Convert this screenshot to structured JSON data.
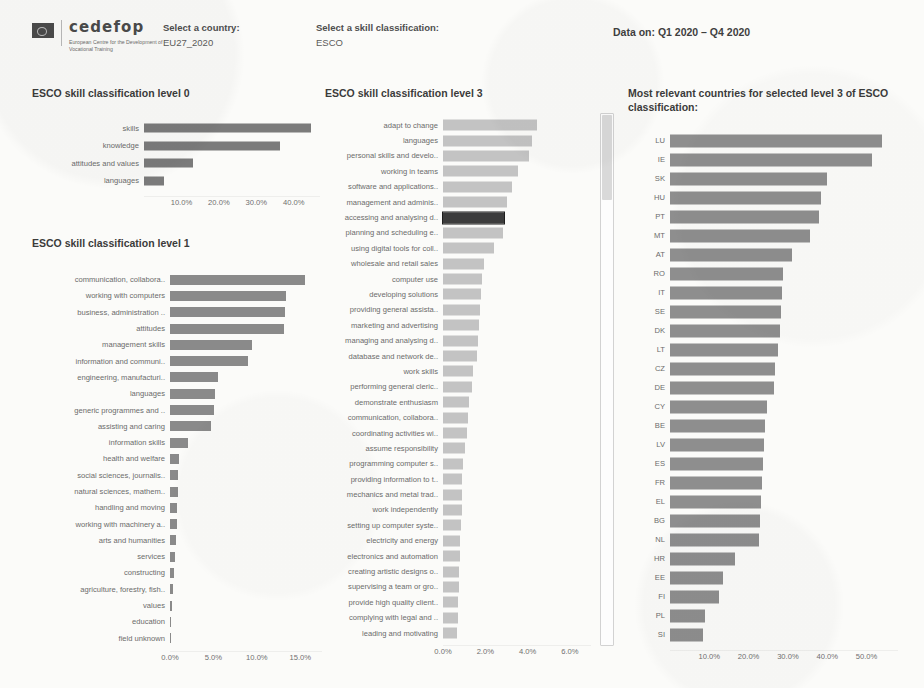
{
  "header": {
    "logo": {
      "name": "cedefop",
      "subtitle": "European Centre for the Development of Vocational Training",
      "flag_icon": "eu-flag-icon"
    },
    "country_field": {
      "label": "Select a country:",
      "value": "EU27_2020"
    },
    "skill_field": {
      "label": "Select a skill classification:",
      "value": "ESCO"
    },
    "data_on": "Data on: Q1 2020 – Q4 2020"
  },
  "colors": {
    "bar_level0": "#7b7b7b",
    "bar_level1": "#8a8a8a",
    "bar_level3": "#c3c3c3",
    "bar_level3_selected": "#3c3c3c",
    "bar_country": "#8e8e8e",
    "text": "#6b6b6b"
  },
  "panels": {
    "level0": {
      "title": "ESCO skill classification level 0"
    },
    "level1": {
      "title": "ESCO skill classification level 1"
    },
    "level3": {
      "title": "ESCO skill classification level 3"
    },
    "countries": {
      "title": "Most relevant countries for selected level 3 of ESCO classification:"
    }
  },
  "chart_data": [
    {
      "id": "level0",
      "type": "bar",
      "orientation": "horizontal",
      "title": "ESCO skill classification level 0",
      "xlabel": "",
      "ylabel": "",
      "xlim": [
        0,
        47
      ],
      "xticks": [
        10,
        20,
        30,
        40
      ],
      "xticklabels": [
        "10.0%",
        "20.0%",
        "30.0%",
        "40.0%"
      ],
      "grid": false,
      "legend": "none",
      "categories": [
        "skills",
        "knowledge",
        "attitudes and values",
        "languages"
      ],
      "values": [
        44.5,
        36.2,
        13.0,
        5.3
      ]
    },
    {
      "id": "level1",
      "type": "bar",
      "orientation": "horizontal",
      "title": "ESCO skill classification level 1",
      "xlabel": "",
      "ylabel": "",
      "xlim": [
        0,
        17.5
      ],
      "xticks": [
        0,
        5,
        10,
        15
      ],
      "xticklabels": [
        "0.0%",
        "5.0%",
        "10.0%",
        "15.0%"
      ],
      "grid": false,
      "legend": "none",
      "categories": [
        "communication, collabora..",
        "working with computers",
        "business, administration ..",
        "attitudes",
        "management skills",
        "information and communi..",
        "engineering, manufacturi..",
        "languages",
        "generic programmes and ..",
        "assisting and caring",
        "information skills",
        "health and welfare",
        "social sciences, journalis..",
        "natural sciences, mathem..",
        "handling and moving",
        "working with machinery a..",
        "arts and humanities",
        "services",
        "constructing",
        "agriculture, forestry, fish..",
        "values",
        "education",
        "field unknown"
      ],
      "values": [
        15.6,
        13.3,
        13.2,
        13.1,
        9.4,
        9.0,
        5.5,
        5.2,
        5.1,
        4.7,
        2.1,
        1.0,
        0.95,
        0.9,
        0.85,
        0.8,
        0.65,
        0.6,
        0.5,
        0.35,
        0.2,
        0.05,
        0.02
      ]
    },
    {
      "id": "level3",
      "type": "bar",
      "orientation": "horizontal",
      "title": "ESCO skill classification level 3",
      "xlabel": "",
      "ylabel": "",
      "xlim": [
        0,
        7.0
      ],
      "xticks": [
        0,
        2,
        4,
        6
      ],
      "xticklabels": [
        "0.0%",
        "2.0%",
        "4.0%",
        "6.0%"
      ],
      "grid": false,
      "legend": "none",
      "selected_category": "accessing and analysing d..",
      "categories": [
        "adapt to change",
        "languages",
        "personal skills and develo..",
        "working in teams",
        "software and applications..",
        "management and adminis..",
        "accessing and analysing d..",
        "planning and scheduling e..",
        "using digital tools for coll..",
        "wholesale and retail sales",
        "computer use",
        "developing solutions",
        "providing general assista..",
        "marketing and advertising",
        "managing and analysing d..",
        "database and network de..",
        "work skills",
        "performing general cleric..",
        "demonstrate enthusiasm",
        "communication, collabora..",
        "coordinating activities wi..",
        "assume responsibility",
        "programming computer s..",
        "providing information to t..",
        "mechanics and metal trad..",
        "work independently",
        "setting up computer syste..",
        "electricity and energy",
        "electronics and automation",
        "creating artistic designs o..",
        "supervising a team or gro..",
        "provide high quality client..",
        "complying with legal and ..",
        "leading and motivating"
      ],
      "values": [
        4.45,
        4.2,
        4.05,
        3.55,
        3.25,
        3.05,
        2.9,
        2.85,
        2.4,
        1.95,
        1.85,
        1.8,
        1.75,
        1.7,
        1.65,
        1.6,
        1.4,
        1.35,
        1.25,
        1.2,
        1.15,
        1.05,
        0.95,
        0.92,
        0.9,
        0.88,
        0.85,
        0.82,
        0.8,
        0.78,
        0.75,
        0.72,
        0.7,
        0.68
      ]
    },
    {
      "id": "countries",
      "type": "bar",
      "orientation": "horizontal",
      "title": "Most relevant countries for selected level 3 of ESCO classification:",
      "xlabel": "",
      "ylabel": "",
      "xlim": [
        0,
        58
      ],
      "xticks": [
        10,
        20,
        30,
        40,
        50
      ],
      "xticklabels": [
        "10.0%",
        "20.0%",
        "30.0%",
        "40.0%",
        "50.0%"
      ],
      "grid": false,
      "legend": "none",
      "categories": [
        "LU",
        "IE",
        "SK",
        "HU",
        "PT",
        "MT",
        "AT",
        "RO",
        "IT",
        "SE",
        "DK",
        "LT",
        "CZ",
        "DE",
        "CY",
        "BE",
        "LV",
        "ES",
        "FR",
        "EL",
        "BG",
        "NL",
        "HR",
        "EE",
        "FI",
        "PL",
        "SI"
      ],
      "values": [
        54.0,
        51.5,
        40.0,
        38.5,
        37.8,
        35.5,
        31.0,
        28.8,
        28.5,
        28.2,
        28.0,
        27.4,
        26.6,
        26.5,
        24.8,
        24.2,
        23.8,
        23.6,
        23.4,
        23.2,
        23.0,
        22.6,
        16.5,
        13.5,
        12.5,
        9.0,
        8.5
      ]
    }
  ],
  "scrollbar": {
    "name": "level3-vertical-scrollbar",
    "thumb_position": "top",
    "thumb_ratio": 0.16
  }
}
